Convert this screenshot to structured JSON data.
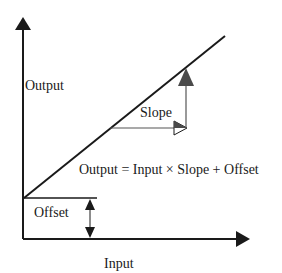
{
  "diagram": {
    "labels": {
      "y_axis": "Output",
      "x_axis": "Input",
      "slope": "Slope",
      "offset": "Offset",
      "equation": "Output = Input × Slope + Offset"
    },
    "colors": {
      "axis": "#1a1a1a",
      "line": "#1a1a1a",
      "slope_guide": "#555555",
      "slope_arrow_fill": "#4a4a4a",
      "background": "#ffffff"
    }
  }
}
